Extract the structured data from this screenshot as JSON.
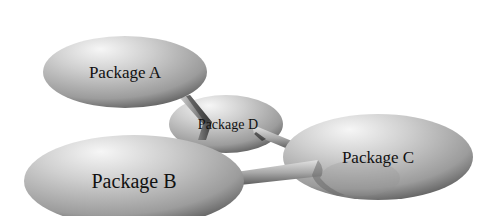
{
  "diagram": {
    "type": "package-dependency-diagram",
    "background": "#ffffff",
    "node_colors": {
      "highlight": "#f4f4f4",
      "mid": "#b8b8b8",
      "shadow": "#4a4a4a",
      "connector_light": "#d0d0d0",
      "connector_dark": "#5a5a5a"
    },
    "nodes": [
      {
        "id": "A",
        "label": "Package A",
        "cx": 125,
        "cy": 72,
        "rx": 82,
        "ry": 36,
        "font_size": 17
      },
      {
        "id": "D",
        "label": "Package D",
        "cx": 226,
        "cy": 124,
        "rx": 57,
        "ry": 29,
        "font_size": 14
      },
      {
        "id": "C",
        "label": "Package C",
        "cx": 378,
        "cy": 157,
        "rx": 95,
        "ry": 43,
        "font_size": 17
      },
      {
        "id": "B",
        "label": "Package B",
        "cx": 134,
        "cy": 181,
        "rx": 110,
        "ry": 46,
        "font_size": 20
      }
    ],
    "edges": [
      {
        "from": "A",
        "to": "D"
      },
      {
        "from": "D",
        "to": "B"
      },
      {
        "from": "D",
        "to": "C"
      },
      {
        "from": "B",
        "to": "C"
      }
    ]
  }
}
